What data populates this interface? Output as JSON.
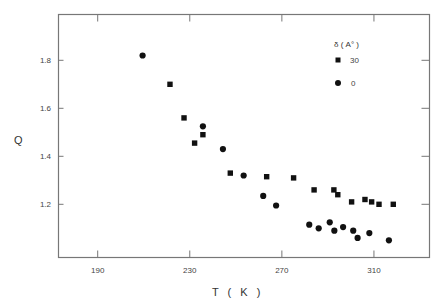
{
  "chart_data": {
    "type": "scatter",
    "title": "",
    "xlabel": "T ( K )",
    "ylabel": "Q",
    "xlim": [
      165,
      335
    ],
    "ylim": [
      1.005,
      1.995
    ],
    "xticks": [
      190,
      230,
      270,
      310
    ],
    "yticks": [
      1.2,
      1.4,
      1.6,
      1.8
    ],
    "xtick_labels": [
      "190",
      "230",
      "270",
      "310"
    ],
    "ytick_labels": [
      "1.2",
      "1.4",
      "1.6",
      "1.8"
    ],
    "grid": false,
    "legend": {
      "title": "δ ( A° )",
      "position": "upper right",
      "entries": [
        {
          "label": "30",
          "marker": "square"
        },
        {
          "label": "0",
          "marker": "circle"
        }
      ]
    },
    "series": [
      {
        "name": "30",
        "marker": "square",
        "color": "#111111",
        "points": [
          {
            "x": 221.4,
            "y": 1.7
          },
          {
            "x": 227.5,
            "y": 1.56
          },
          {
            "x": 232.1,
            "y": 1.455
          },
          {
            "x": 235.7,
            "y": 1.49
          },
          {
            "x": 247.6,
            "y": 1.33
          },
          {
            "x": 263.4,
            "y": 1.315
          },
          {
            "x": 275.1,
            "y": 1.31
          },
          {
            "x": 284.0,
            "y": 1.26
          },
          {
            "x": 292.6,
            "y": 1.26
          },
          {
            "x": 294.3,
            "y": 1.24
          },
          {
            "x": 300.3,
            "y": 1.21
          },
          {
            "x": 306.1,
            "y": 1.22
          },
          {
            "x": 309.0,
            "y": 1.21
          },
          {
            "x": 312.2,
            "y": 1.2
          },
          {
            "x": 318.4,
            "y": 1.2
          }
        ]
      },
      {
        "name": "0",
        "marker": "circle",
        "color": "#111111",
        "points": [
          {
            "x": 209.5,
            "y": 1.82
          },
          {
            "x": 235.7,
            "y": 1.525
          },
          {
            "x": 244.4,
            "y": 1.43
          },
          {
            "x": 253.4,
            "y": 1.32
          },
          {
            "x": 261.9,
            "y": 1.235
          },
          {
            "x": 267.5,
            "y": 1.195
          },
          {
            "x": 281.9,
            "y": 1.115
          },
          {
            "x": 286.0,
            "y": 1.1
          },
          {
            "x": 290.8,
            "y": 1.125
          },
          {
            "x": 292.8,
            "y": 1.09
          },
          {
            "x": 296.6,
            "y": 1.105
          },
          {
            "x": 301.0,
            "y": 1.09
          },
          {
            "x": 302.9,
            "y": 1.06
          },
          {
            "x": 308.0,
            "y": 1.08
          },
          {
            "x": 316.5,
            "y": 1.05
          }
        ]
      }
    ]
  },
  "colors": {
    "axis": "#777777",
    "marker": "#111111",
    "text": "#444444",
    "background": "#ffffff"
  }
}
